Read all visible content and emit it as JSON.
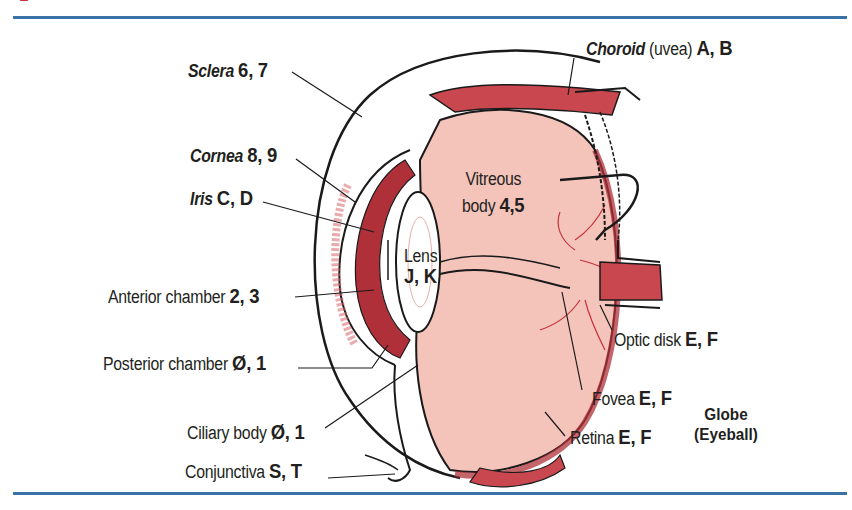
{
  "figure": {
    "title": "Globe (Eyeball)",
    "title_line1": "Globe",
    "title_line2": "(Eyeball)",
    "colors": {
      "rule": "#3a73a6",
      "tissue_dark": "#b0303a",
      "tissue_mid": "#d9666a",
      "vitreous": "#f4c4bb",
      "outline": "#1a1a1a"
    }
  },
  "labels": {
    "sclera": {
      "name": "Sclera",
      "codes": "6, 7"
    },
    "cornea": {
      "name": "Cornea",
      "codes": "8, 9"
    },
    "iris": {
      "name": "Iris",
      "codes": "C, D"
    },
    "anterior_chamber": {
      "name": "Anterior chamber",
      "codes": "2, 3"
    },
    "posterior_chamber": {
      "name": "Posterior chamber",
      "codes": "Ø, 1"
    },
    "ciliary_body": {
      "name": "Ciliary body",
      "codes": "Ø, 1"
    },
    "conjunctiva": {
      "name": "Conjunctiva",
      "codes": "S, T"
    },
    "choroid": {
      "name": "Choroid",
      "qualifier": "(uvea)",
      "codes": "A, B"
    },
    "vitreous_body": {
      "name_line1": "Vitreous",
      "name_line2": "body",
      "codes": "4,5"
    },
    "lens": {
      "name": "Lens",
      "codes": "J, K"
    },
    "optic_disk": {
      "name": "Optic disk",
      "codes": "E, F"
    },
    "fovea": {
      "name": "Fovea",
      "codes": "E, F"
    },
    "retina": {
      "name": "Retina",
      "codes": "E, F"
    }
  }
}
